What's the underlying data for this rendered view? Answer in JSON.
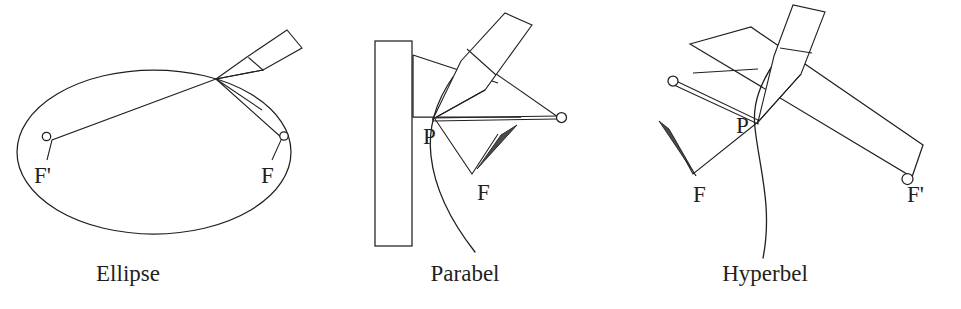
{
  "figure": {
    "background_color": "#ffffff",
    "ink_color": "#231f20",
    "width": 961,
    "height": 309
  },
  "panels": [
    {
      "id": "ellipse",
      "caption": "Ellipse",
      "curve_type": "ellipse",
      "labels": {
        "focus_left": "F'",
        "focus_right": "F",
        "point": ""
      },
      "instruments": [
        "pencil",
        "string",
        "two-pins"
      ],
      "description": "Closed ellipse drawn with a taut string looped around two pins F' and F, pencil tracing at the top-right of the curve."
    },
    {
      "id": "parabola",
      "caption": "Parabel",
      "curve_type": "parabola",
      "labels": {
        "point": "P",
        "focus": "F",
        "ring": ""
      },
      "instruments": [
        "ruler",
        "set-square",
        "pencil",
        "string",
        "pin",
        "ring"
      ],
      "description": "Parabola traced with a set square sliding along a vertical ruler (directrix), string from the ring at the square's edge running to focus F, pencil held at P."
    },
    {
      "id": "hyperbola",
      "caption": "Hyperbel",
      "curve_type": "hyperbola",
      "labels": {
        "point": "P",
        "focus_left": "F",
        "focus_right": "F'"
      },
      "instruments": [
        "ruler",
        "pencil",
        "string",
        "pin",
        "two-rings"
      ],
      "description": "Hyperbola branch drawn with a rotating ruler pinned at F', string fixed at F running back along the ruler, pencil pressing the string at P."
    }
  ]
}
